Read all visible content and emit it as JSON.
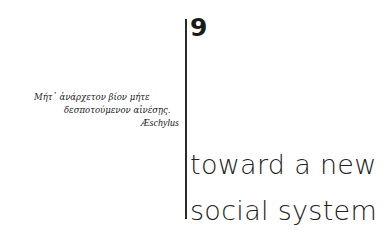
{
  "chapter": {
    "number": "9",
    "title_lines": [
      "toward a new",
      "social system"
    ]
  },
  "epigraph": {
    "lines": [
      "Μήτ᾽ ἀνάρχετον βίον μήτε",
      "δεσποτούμενον αἰνέσῃς."
    ],
    "author": "Æschylus"
  }
}
